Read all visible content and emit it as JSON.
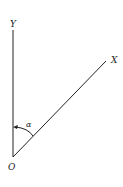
{
  "diagram": {
    "labels": {
      "y_axis": "Y",
      "x_axis": "X",
      "origin": "O",
      "angle": "α"
    },
    "colors": {
      "line": "#222222",
      "background": "#ffffff"
    }
  }
}
